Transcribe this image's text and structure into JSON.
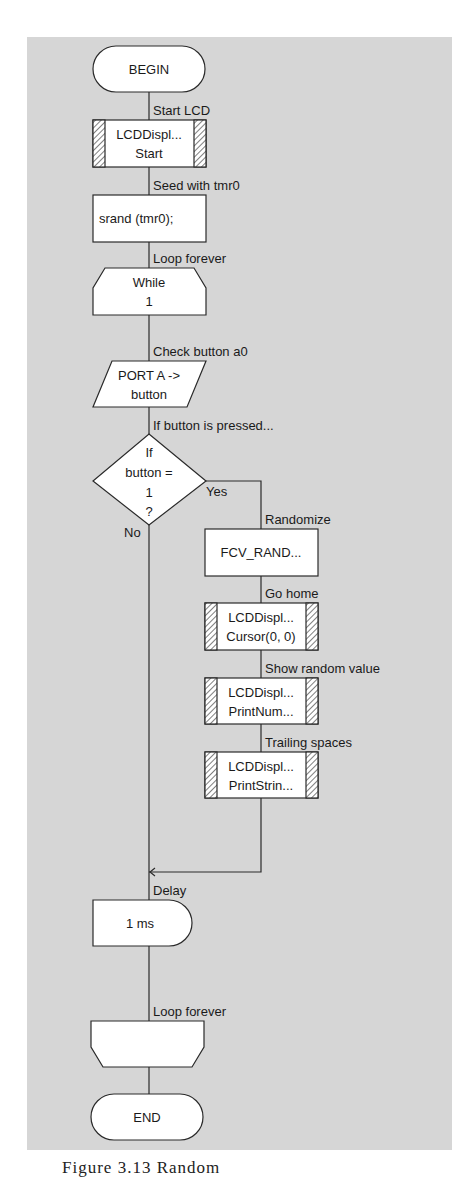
{
  "flowchart": {
    "begin": "BEGIN",
    "end": "END",
    "steps": {
      "start_lcd": {
        "label": "Start LCD",
        "line1": "LCDDispl...",
        "line2": "Start"
      },
      "seed": {
        "label": "Seed with tmr0",
        "text": "srand (tmr0);"
      },
      "loop_start": {
        "label": "Loop forever",
        "line1": "While",
        "line2": "1"
      },
      "input": {
        "label": "Check button a0",
        "line1": "PORT A ->",
        "line2": "button"
      },
      "decision": {
        "label": "If button is pressed...",
        "line1": "If",
        "line2": "button =",
        "line3": "1",
        "line4": "?",
        "yes": "Yes",
        "no": "No"
      },
      "randomize": {
        "label": "Randomize",
        "text": "FCV_RAND..."
      },
      "go_home": {
        "label": "Go home",
        "line1": "LCDDispl...",
        "line2": "Cursor(0, 0)"
      },
      "show_value": {
        "label": "Show random value",
        "line1": "LCDDispl...",
        "line2": "PrintNum..."
      },
      "trailing": {
        "label": "Trailing spaces",
        "line1": "LCDDispl...",
        "line2": "PrintStrin..."
      },
      "delay": {
        "label": "Delay",
        "text": "1 ms"
      },
      "loop_end": {
        "label": "Loop forever"
      }
    }
  },
  "caption": "Figure 3.13  Random"
}
